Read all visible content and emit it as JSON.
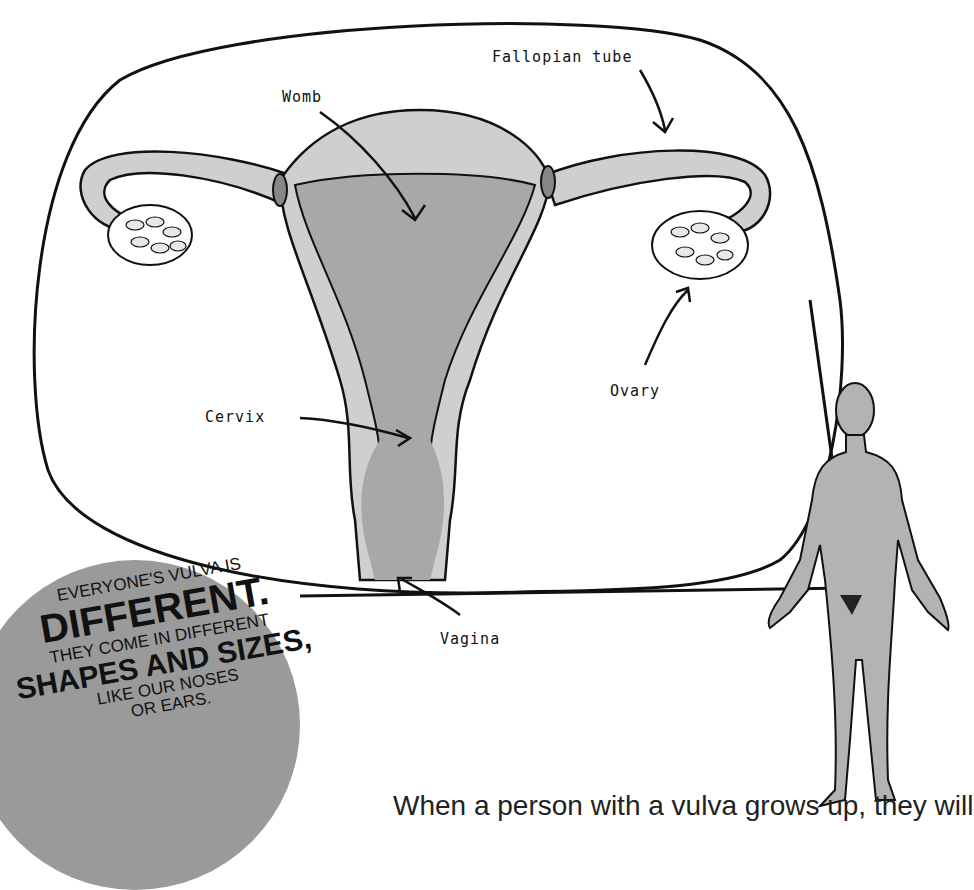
{
  "labels": {
    "womb": "Womb",
    "fallopian_tube": "Fallopian tube",
    "ovary": "Ovary",
    "cervix": "Cervix",
    "vagina": "Vagina"
  },
  "badge": {
    "line1": "EVERYONE'S VULVA IS",
    "line2": "DIFFERENT.",
    "line3": "THEY COME IN DIFFERENT",
    "line4": "SHAPES AND SIZES,",
    "line5": "LIKE OUR NOSES",
    "line6": "OR EARS."
  },
  "body_text": "When a person with a vulva grows up, they will",
  "colors": {
    "light_gray": "#cfcfcf",
    "dark_gray": "#a8a8a8",
    "badge": "#9a9a9a",
    "figure": "#b3b3b3"
  }
}
